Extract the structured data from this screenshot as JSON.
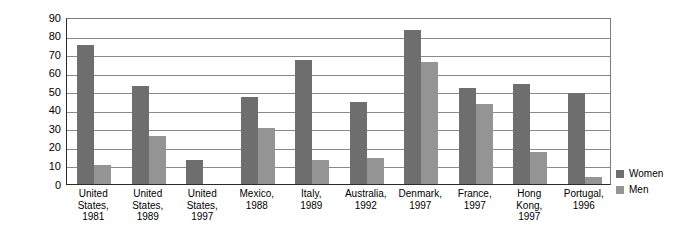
{
  "chart_data": {
    "type": "bar",
    "title": "",
    "subtitle": "",
    "xlabel": "",
    "ylabel": "Percentage shown\nin dependent role",
    "ylim": [
      0,
      90
    ],
    "ytick_step": 10,
    "yticks": [
      "90",
      "80",
      "70",
      "60",
      "50",
      "40",
      "30",
      "20",
      "10",
      "0"
    ],
    "grid": true,
    "legend_position": "right",
    "categories": [
      "United\nStates,\n1981",
      "United\nStates,\n1989",
      "United\nStates,\n1997",
      "Mexico,\n1988",
      "Italy,\n1989",
      "Australia,\n1992",
      "Denmark,\n1997",
      "France,\n1997",
      "Hong\nKong,\n1997",
      "Portugal,\n1996"
    ],
    "series": [
      {
        "name": "Women",
        "color": "#6e6e6e",
        "values": [
          75,
          53,
          13,
          47,
          67,
          44,
          83,
          52,
          54,
          49
        ]
      },
      {
        "name": "Men",
        "color": "#949494",
        "values": [
          10,
          26,
          0,
          30,
          13,
          14,
          66,
          43,
          17,
          4
        ]
      }
    ]
  },
  "legend": {
    "items": [
      {
        "label": "Women",
        "color": "#6e6e6e"
      },
      {
        "label": "Men",
        "color": "#949494"
      }
    ]
  }
}
